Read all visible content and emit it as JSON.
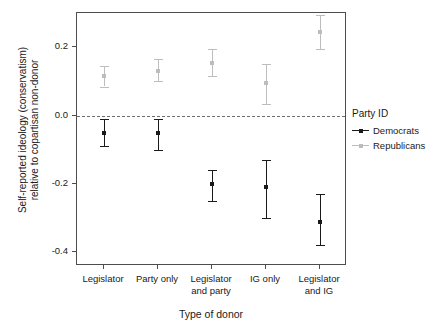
{
  "chart_data": {
    "type": "scatter",
    "title": "",
    "xlabel": "Type of donor",
    "ylabel": "Self-reported ideology (conservatism)\nrelative to copartisan non-donor",
    "categories": [
      "Legislator",
      "Party only",
      "Legislator\nand party",
      "IG only",
      "Legislator\nand IG"
    ],
    "ylim": [
      -0.44,
      0.3
    ],
    "yticks": [
      0.2,
      0.0,
      -0.2,
      -0.4
    ],
    "ytick_labels": [
      "0.2",
      "0.0",
      "-0.2",
      "-0.4"
    ],
    "grid": false,
    "legend_position": "right",
    "reference_line": {
      "y": 0.0,
      "style": "dashed",
      "color": "#6f6f6f"
    },
    "legend_title": "Party ID",
    "series": [
      {
        "name": "Democrats",
        "color": "#1a1a1a",
        "values": [
          -0.05,
          -0.05,
          -0.2,
          -0.21,
          -0.31
        ],
        "ci_low": [
          -0.09,
          -0.1,
          -0.25,
          -0.3,
          -0.38
        ],
        "ci_high": [
          -0.01,
          -0.01,
          -0.16,
          -0.13,
          -0.23
        ]
      },
      {
        "name": "Republicans",
        "color": "#bdbdbd",
        "values": [
          0.115,
          0.13,
          0.155,
          0.095,
          0.245
        ],
        "ci_low": [
          0.085,
          0.1,
          0.115,
          0.035,
          0.195
        ],
        "ci_high": [
          0.145,
          0.165,
          0.195,
          0.15,
          0.295
        ]
      }
    ]
  },
  "legend": {
    "title": "Party ID",
    "items": [
      {
        "label": "Democrats",
        "color": "#1a1a1a"
      },
      {
        "label": "Republicans",
        "color": "#bdbdbd"
      }
    ]
  },
  "axes": {
    "x_title": "Type of donor",
    "y_title": "Self-reported ideology (conservatism)\nrelative to copartisan non-donor"
  }
}
